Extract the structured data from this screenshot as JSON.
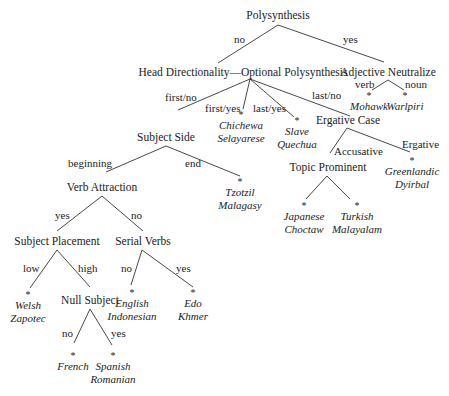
{
  "diagram": {
    "type": "parameter-hierarchy-tree",
    "root": {
      "label": "Polysynthesis",
      "edges": {
        "no": "no",
        "yes": "yes"
      }
    },
    "nodes": {
      "polysynthesis": "Polysynthesis",
      "head_directionality": "Head Directionality—Optional Polysynthesis",
      "adjective_neutralize": "Adjective Neutralize",
      "subject_side": "Subject Side",
      "ergative_case": "Ergative Case",
      "verb_attraction": "Verb Attraction",
      "topic_prominent": "Topic Prominent",
      "subject_placement": "Subject Placement",
      "serial_verbs": "Serial Verbs",
      "null_subject": "Null Subject"
    },
    "edge_labels": {
      "poly_no": "no",
      "poly_yes": "yes",
      "adj_verb": "verb",
      "adj_noun": "noun",
      "hd_first_no": "first/no",
      "hd_first_yes": "first/yes",
      "hd_last_yes": "last/yes",
      "hd_last_no": "last/no",
      "ss_beginning": "beginning",
      "ss_end": "end",
      "ec_accusative": "Accusative",
      "ec_ergative": "Ergative",
      "va_yes": "yes",
      "va_no": "no",
      "sp_low": "low",
      "sp_high": "high",
      "sv_no": "no",
      "sv_yes": "yes",
      "ns_no": "no",
      "ns_yes": "yes"
    },
    "leaves": {
      "mohawk": {
        "star": "*",
        "line1": "Mohawk",
        "line2": ""
      },
      "warlpiri": {
        "star": "*",
        "line1": "Warlpiri",
        "line2": ""
      },
      "chichewa": {
        "star": "*",
        "line1": "Chichewa",
        "line2": "Selayarese"
      },
      "slave": {
        "star": "*",
        "line1": "Slave",
        "line2": "Quechua"
      },
      "greenlandic": {
        "star": "*",
        "line1": "Greenlandic",
        "line2": "Dyirbal"
      },
      "tzotzil": {
        "star": "*",
        "line1": "Tzotzil",
        "line2": "Malagasy"
      },
      "japanese": {
        "star": "*",
        "line1": "Japanese",
        "line2": "Choctaw"
      },
      "turkish": {
        "star": "*",
        "line1": "Turkish",
        "line2": "Malayalam"
      },
      "welsh": {
        "star": "*",
        "line1": "Welsh",
        "line2": "Zapotec"
      },
      "english": {
        "star": "*",
        "line1": "English",
        "line2": "Indonesian"
      },
      "edo": {
        "star": "*",
        "line1": "Edo",
        "line2": "Khmer"
      },
      "french": {
        "star": "*",
        "line1": "French",
        "line2": ""
      },
      "spanish": {
        "star": "*",
        "line1": "Spanish",
        "line2": "Romanian"
      }
    }
  }
}
